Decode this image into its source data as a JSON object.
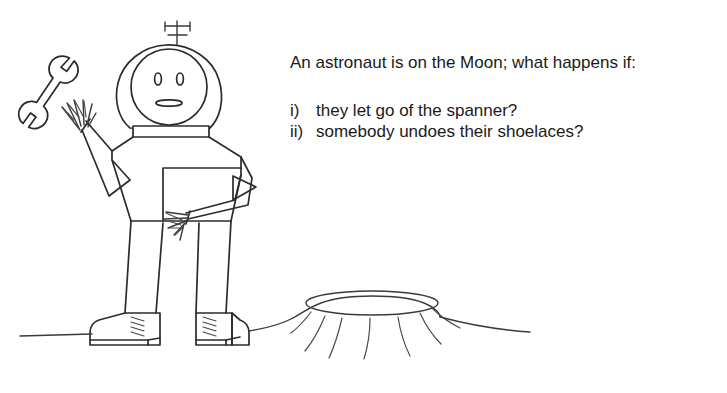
{
  "image": {
    "kind": "hand-drawn-cartoon-with-caption",
    "background_color": "#ffffff",
    "ink_color": "#2b2b2b",
    "width": 727,
    "height": 393
  },
  "caption": {
    "question": "An astronaut is on the Moon; what happens if:",
    "options": [
      {
        "marker": "i)",
        "text": "they let go of the spanner?"
      },
      {
        "marker": "ii)",
        "text": "somebody undoes their shoelaces?"
      }
    ]
  },
  "drawing": {
    "title": "astronaut standing on the moon next to a crater",
    "parts": [
      {
        "name": "antenna",
        "label": "helmet antenna"
      },
      {
        "name": "helmet",
        "label": "space helmet dome"
      },
      {
        "name": "face",
        "label": "astronaut face"
      },
      {
        "name": "eye-left",
        "label": "left eye"
      },
      {
        "name": "eye-right",
        "label": "right eye"
      },
      {
        "name": "mouth",
        "label": "mouth"
      },
      {
        "name": "collar",
        "label": "helmet neck ring"
      },
      {
        "name": "torso",
        "label": "spacesuit torso"
      },
      {
        "name": "left-arm",
        "label": "raised left arm"
      },
      {
        "name": "left-hand",
        "label": "open left hand letting go"
      },
      {
        "name": "right-arm",
        "label": "right arm on hip"
      },
      {
        "name": "right-hand",
        "label": "right hand on hip"
      },
      {
        "name": "left-leg",
        "label": "left leg"
      },
      {
        "name": "right-leg",
        "label": "right leg"
      },
      {
        "name": "left-boot",
        "label": "left boot with laces"
      },
      {
        "name": "right-boot",
        "label": "right boot with laces"
      },
      {
        "name": "spanner",
        "label": "floating double open-ended spanner"
      },
      {
        "name": "ground-line",
        "label": "lunar horizon line"
      },
      {
        "name": "crater",
        "label": "moon crater"
      }
    ]
  }
}
